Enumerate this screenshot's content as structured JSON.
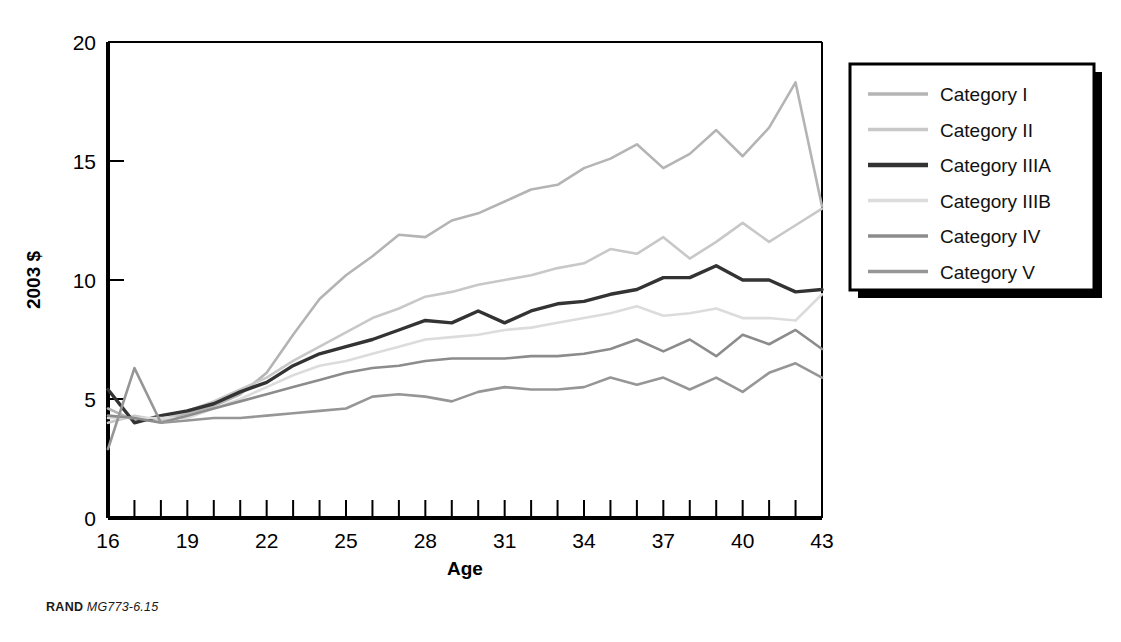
{
  "caption": {
    "org": "RAND",
    "figure_id": "MG773-6.15"
  },
  "chart_data": {
    "type": "line",
    "title": "",
    "xlabel": "Age",
    "ylabel": "2003 $",
    "xlim": [
      16,
      43
    ],
    "ylim": [
      0,
      20
    ],
    "xticks": [
      16,
      17,
      18,
      19,
      20,
      21,
      22,
      23,
      24,
      25,
      26,
      27,
      28,
      29,
      30,
      31,
      32,
      33,
      34,
      35,
      36,
      37,
      38,
      39,
      40,
      41,
      42,
      43
    ],
    "xticklabels": [
      "16",
      "",
      "",
      "19",
      "",
      "",
      "22",
      "",
      "",
      "25",
      "",
      "",
      "28",
      "",
      "",
      "31",
      "",
      "",
      "34",
      "",
      "",
      "37",
      "",
      "",
      "40",
      "",
      "",
      "43"
    ],
    "yticks": [
      0,
      5,
      10,
      15,
      20
    ],
    "yticklabels": [
      "0",
      "5",
      "10",
      "15",
      "20"
    ],
    "grid": false,
    "legend_position": "right",
    "x": [
      16,
      17,
      18,
      19,
      20,
      21,
      22,
      23,
      24,
      25,
      26,
      27,
      28,
      29,
      30,
      31,
      32,
      33,
      34,
      35,
      36,
      37,
      38,
      39,
      40,
      41,
      42,
      43
    ],
    "series": [
      {
        "name": "Category I",
        "color": "#b4b4b4",
        "width": 2.6,
        "values": [
          4.6,
          4.1,
          4.1,
          4.4,
          4.7,
          5.2,
          6.1,
          7.7,
          9.2,
          10.2,
          11.0,
          11.9,
          11.8,
          12.5,
          12.8,
          13.3,
          13.8,
          14.0,
          14.7,
          15.1,
          15.7,
          14.7,
          15.3,
          16.3,
          15.2,
          16.4,
          18.3,
          13.1
        ]
      },
      {
        "name": "Category II",
        "color": "#c8c8c8",
        "width": 2.6,
        "values": [
          4.0,
          4.3,
          4.1,
          4.5,
          4.9,
          5.4,
          5.9,
          6.6,
          7.2,
          7.8,
          8.4,
          8.8,
          9.3,
          9.5,
          9.8,
          10.0,
          10.2,
          10.5,
          10.7,
          11.3,
          11.1,
          11.8,
          10.9,
          11.6,
          12.4,
          11.6,
          12.3,
          13.0
        ]
      },
      {
        "name": "Category IIIA",
        "color": "#333333",
        "width": 3.4,
        "values": [
          5.4,
          4.0,
          4.3,
          4.5,
          4.8,
          5.3,
          5.7,
          6.4,
          6.9,
          7.2,
          7.5,
          7.9,
          8.3,
          8.2,
          8.7,
          8.2,
          8.7,
          9.0,
          9.1,
          9.4,
          9.6,
          10.1,
          10.1,
          10.6,
          10.0,
          10.0,
          9.5,
          9.6
        ]
      },
      {
        "name": "Category IIIB",
        "color": "#dcdcdc",
        "width": 2.6,
        "values": [
          4.2,
          4.2,
          4.2,
          4.2,
          4.6,
          5.0,
          5.5,
          6.0,
          6.4,
          6.6,
          6.9,
          7.2,
          7.5,
          7.6,
          7.7,
          7.9,
          8.0,
          8.2,
          8.4,
          8.6,
          8.9,
          8.5,
          8.6,
          8.8,
          8.4,
          8.4,
          8.3,
          9.4
        ]
      },
      {
        "name": "Category IV",
        "color": "#8c8c8c",
        "width": 2.6,
        "values": [
          4.3,
          4.2,
          4.0,
          4.3,
          4.6,
          4.9,
          5.2,
          5.5,
          5.8,
          6.1,
          6.3,
          6.4,
          6.6,
          6.7,
          6.7,
          6.7,
          6.8,
          6.8,
          6.9,
          7.1,
          7.5,
          7.0,
          7.5,
          6.8,
          7.7,
          7.3,
          7.9,
          7.1
        ]
      },
      {
        "name": "Category V",
        "color": "#969696",
        "width": 2.6,
        "values": [
          2.9,
          6.3,
          4.0,
          4.1,
          4.2,
          4.2,
          4.3,
          4.4,
          4.5,
          4.6,
          5.1,
          5.2,
          5.1,
          4.9,
          5.3,
          5.5,
          5.4,
          5.4,
          5.5,
          5.9,
          5.6,
          5.9,
          5.4,
          5.9,
          5.3,
          6.1,
          6.5,
          5.9
        ]
      }
    ]
  },
  "legend": {
    "items": [
      {
        "label": "Category I"
      },
      {
        "label": "Category II"
      },
      {
        "label": "Category IIIA"
      },
      {
        "label": "Category IIIB"
      },
      {
        "label": "Category IV"
      },
      {
        "label": "Category V"
      }
    ]
  }
}
